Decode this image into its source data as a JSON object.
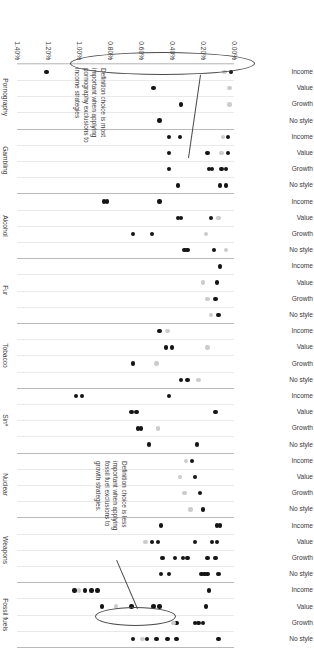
{
  "chart_data": {
    "type": "scatter",
    "title": "",
    "xlabel": "",
    "ylabel": "",
    "xlim": [
      0.0,
      1.4
    ],
    "grid": true,
    "legend_position": "none",
    "xtick_labels": [
      "0.00%",
      "0.20%",
      "0.40%",
      "0.60%",
      "0.80%",
      "1.00%",
      "1.20%",
      "1.40%"
    ],
    "xtick_values": [
      0.0,
      0.2,
      0.4,
      0.6,
      0.8,
      1.0,
      1.2,
      1.4
    ],
    "row_categories": [
      "No style",
      "Growth",
      "Value",
      "Income"
    ],
    "groups": [
      {
        "name": "Fossil fuels",
        "rows": [
          {
            "label": "No style",
            "points": [
              {
                "x": 0.1,
                "shade": "dark"
              },
              {
                "x": 0.37,
                "shade": "dark"
              },
              {
                "x": 0.43,
                "shade": "dark"
              },
              {
                "x": 0.5,
                "shade": "dark"
              },
              {
                "x": 0.56,
                "shade": "dark"
              },
              {
                "x": 0.59,
                "shade": "light"
              },
              {
                "x": 0.65,
                "shade": "dark"
              }
            ]
          },
          {
            "label": "Growth",
            "points": [
              {
                "x": 0.2,
                "shade": "dark"
              },
              {
                "x": 0.23,
                "shade": "dark"
              },
              {
                "x": 0.25,
                "shade": "dark"
              },
              {
                "x": 0.37,
                "shade": "dark"
              },
              {
                "x": 0.39,
                "shade": "light"
              }
            ]
          },
          {
            "label": "Value",
            "points": [
              {
                "x": 0.18,
                "shade": "dark"
              },
              {
                "x": 0.48,
                "shade": "dark"
              },
              {
                "x": 0.52,
                "shade": "dark"
              },
              {
                "x": 0.66,
                "shade": "dark"
              },
              {
                "x": 0.76,
                "shade": "light"
              },
              {
                "x": 0.85,
                "shade": "dark"
              }
            ]
          },
          {
            "label": "Income",
            "points": [
              {
                "x": 0.16,
                "shade": "dark"
              },
              {
                "x": 0.88,
                "shade": "dark"
              },
              {
                "x": 0.92,
                "shade": "dark"
              },
              {
                "x": 0.96,
                "shade": "dark"
              },
              {
                "x": 1.0,
                "shade": "light"
              },
              {
                "x": 1.03,
                "shade": "dark"
              }
            ]
          }
        ]
      },
      {
        "name": "Weapons",
        "rows": [
          {
            "label": "No style",
            "points": [
              {
                "x": 0.1,
                "shade": "dark"
              },
              {
                "x": 0.17,
                "shade": "dark"
              },
              {
                "x": 0.19,
                "shade": "dark"
              },
              {
                "x": 0.21,
                "shade": "dark"
              },
              {
                "x": 0.42,
                "shade": "dark"
              },
              {
                "x": 0.47,
                "shade": "dark"
              }
            ]
          },
          {
            "label": "Growth",
            "points": [
              {
                "x": 0.12,
                "shade": "dark"
              },
              {
                "x": 0.17,
                "shade": "dark"
              },
              {
                "x": 0.3,
                "shade": "dark"
              },
              {
                "x": 0.33,
                "shade": "dark"
              },
              {
                "x": 0.38,
                "shade": "dark"
              },
              {
                "x": 0.46,
                "shade": "dark"
              }
            ]
          },
          {
            "label": "Value",
            "points": [
              {
                "x": 0.11,
                "shade": "dark"
              },
              {
                "x": 0.14,
                "shade": "dark"
              },
              {
                "x": 0.25,
                "shade": "dark"
              },
              {
                "x": 0.49,
                "shade": "dark"
              },
              {
                "x": 0.53,
                "shade": "dark"
              },
              {
                "x": 0.57,
                "shade": "light"
              }
            ]
          },
          {
            "label": "Income",
            "points": [
              {
                "x": 0.09,
                "shade": "dark"
              },
              {
                "x": 0.11,
                "shade": "dark"
              },
              {
                "x": 0.47,
                "shade": "dark"
              }
            ]
          }
        ]
      },
      {
        "name": "Nuclear",
        "rows": [
          {
            "label": "No style",
            "points": [
              {
                "x": 0.2,
                "shade": "dark"
              },
              {
                "x": 0.28,
                "shade": "light"
              }
            ]
          },
          {
            "label": "Growth",
            "points": [
              {
                "x": 0.22,
                "shade": "dark"
              },
              {
                "x": 0.32,
                "shade": "light"
              }
            ]
          },
          {
            "label": "Value",
            "points": [
              {
                "x": 0.25,
                "shade": "dark"
              },
              {
                "x": 0.35,
                "shade": "light"
              }
            ]
          },
          {
            "label": "Income",
            "points": [
              {
                "x": 0.27,
                "shade": "dark"
              },
              {
                "x": 0.31,
                "shade": "light"
              }
            ]
          }
        ]
      },
      {
        "name": "Sin*",
        "rows": [
          {
            "label": "No style",
            "points": [
              {
                "x": 0.24,
                "shade": "dark"
              },
              {
                "x": 0.55,
                "shade": "dark"
              }
            ]
          },
          {
            "label": "Growth",
            "points": [
              {
                "x": 0.49,
                "shade": "light"
              },
              {
                "x": 0.6,
                "shade": "dark"
              },
              {
                "x": 0.62,
                "shade": "dark"
              }
            ]
          },
          {
            "label": "Value",
            "points": [
              {
                "x": 0.12,
                "shade": "dark"
              },
              {
                "x": 0.63,
                "shade": "dark"
              },
              {
                "x": 0.66,
                "shade": "dark"
              }
            ]
          },
          {
            "label": "Income",
            "points": [
              {
                "x": 0.42,
                "shade": "dark"
              },
              {
                "x": 0.98,
                "shade": "dark"
              },
              {
                "x": 1.02,
                "shade": "dark"
              }
            ]
          }
        ]
      },
      {
        "name": "Tobacco",
        "rows": [
          {
            "label": "No style",
            "points": [
              {
                "x": 0.23,
                "shade": "light"
              },
              {
                "x": 0.3,
                "shade": "dark"
              },
              {
                "x": 0.34,
                "shade": "dark"
              }
            ]
          },
          {
            "label": "Growth",
            "points": [
              {
                "x": 0.5,
                "shade": "light"
              },
              {
                "x": 0.65,
                "shade": "dark"
              }
            ]
          },
          {
            "label": "Value",
            "points": [
              {
                "x": 0.17,
                "shade": "light"
              },
              {
                "x": 0.4,
                "shade": "dark"
              },
              {
                "x": 0.44,
                "shade": "dark"
              }
            ]
          },
          {
            "label": "Income",
            "points": [
              {
                "x": 0.43,
                "shade": "light"
              },
              {
                "x": 0.48,
                "shade": "dark"
              }
            ]
          }
        ]
      },
      {
        "name": "Fur",
        "rows": [
          {
            "label": "No style",
            "points": [
              {
                "x": 0.1,
                "shade": "dark"
              },
              {
                "x": 0.15,
                "shade": "light"
              }
            ]
          },
          {
            "label": "Growth",
            "points": [
              {
                "x": 0.12,
                "shade": "dark"
              },
              {
                "x": 0.17,
                "shade": "light"
              }
            ]
          },
          {
            "label": "Value",
            "points": [
              {
                "x": 0.11,
                "shade": "dark"
              },
              {
                "x": 0.2,
                "shade": "light"
              }
            ]
          },
          {
            "label": "Income",
            "points": [
              {
                "x": 0.09,
                "shade": "dark"
              }
            ]
          }
        ]
      },
      {
        "name": "Alcohol",
        "rows": [
          {
            "label": "No style",
            "points": [
              {
                "x": 0.05,
                "shade": "light"
              },
              {
                "x": 0.13,
                "shade": "dark"
              },
              {
                "x": 0.3,
                "shade": "dark"
              },
              {
                "x": 0.32,
                "shade": "dark"
              }
            ]
          },
          {
            "label": "Growth",
            "points": [
              {
                "x": 0.18,
                "shade": "light"
              },
              {
                "x": 0.53,
                "shade": "dark"
              },
              {
                "x": 0.65,
                "shade": "dark"
              }
            ]
          },
          {
            "label": "Value",
            "points": [
              {
                "x": 0.1,
                "shade": "light"
              },
              {
                "x": 0.15,
                "shade": "dark"
              },
              {
                "x": 0.34,
                "shade": "dark"
              },
              {
                "x": 0.36,
                "shade": "dark"
              }
            ]
          },
          {
            "label": "Income",
            "points": [
              {
                "x": 0.48,
                "shade": "dark"
              },
              {
                "x": 0.82,
                "shade": "dark"
              },
              {
                "x": 0.84,
                "shade": "dark"
              }
            ]
          }
        ]
      },
      {
        "name": "Gambling",
        "rows": [
          {
            "label": "No style",
            "points": [
              {
                "x": 0.05,
                "shade": "dark"
              },
              {
                "x": 0.09,
                "shade": "dark"
              },
              {
                "x": 0.36,
                "shade": "dark"
              }
            ]
          },
          {
            "label": "Growth",
            "points": [
              {
                "x": 0.05,
                "shade": "dark"
              },
              {
                "x": 0.08,
                "shade": "dark"
              },
              {
                "x": 0.14,
                "shade": "dark"
              },
              {
                "x": 0.16,
                "shade": "dark"
              },
              {
                "x": 0.42,
                "shade": "dark"
              }
            ]
          },
          {
            "label": "Value",
            "points": [
              {
                "x": 0.04,
                "shade": "dark"
              },
              {
                "x": 0.08,
                "shade": "light"
              },
              {
                "x": 0.17,
                "shade": "dark"
              },
              {
                "x": 0.42,
                "shade": "dark"
              }
            ]
          },
          {
            "label": "Income",
            "points": [
              {
                "x": 0.04,
                "shade": "dark"
              },
              {
                "x": 0.07,
                "shade": "light"
              },
              {
                "x": 0.35,
                "shade": "dark"
              },
              {
                "x": 0.42,
                "shade": "dark"
              }
            ]
          }
        ]
      },
      {
        "name": "Pornography",
        "rows": [
          {
            "label": "No style",
            "points": [
              {
                "x": 0.48,
                "shade": "dark"
              }
            ]
          },
          {
            "label": "Growth",
            "points": [
              {
                "x": 0.03,
                "shade": "light"
              },
              {
                "x": 0.34,
                "shade": "dark"
              }
            ]
          },
          {
            "label": "Value",
            "points": [
              {
                "x": 0.03,
                "shade": "light"
              },
              {
                "x": 0.52,
                "shade": "dark"
              }
            ]
          },
          {
            "label": "Income",
            "points": [
              {
                "x": 0.02,
                "shade": "dark"
              },
              {
                "x": 0.06,
                "shade": "light"
              },
              {
                "x": 1.21,
                "shade": "dark"
              }
            ]
          }
        ]
      }
    ],
    "annotations": [
      {
        "id": "pornography-callout",
        "text": "Definition choice is most\nimportant when applying\npornography exclusions to\nincome strategies"
      },
      {
        "id": "fossil-fuels-callout",
        "text": "Definition choice is less\nimportant when applying\nfossil fuel exclusions to\ngrowth strategies."
      }
    ],
    "colors": {
      "dark_marker": "#151515",
      "light_marker": "#cccccc",
      "gridline": "#e9e9e9",
      "group_rule": "#b9b9b9",
      "callout_outline": "#4a4a4a"
    }
  }
}
